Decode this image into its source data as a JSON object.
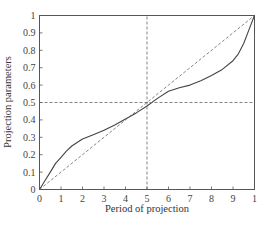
{
  "chart_data": {
    "type": "line",
    "title": "",
    "xlabel": "Period of projection",
    "ylabel": "Projection parameters",
    "xlim": [
      0,
      10
    ],
    "ylim": [
      0,
      1
    ],
    "x_ticks": [
      "0",
      "1",
      "2",
      "3",
      "4",
      "5",
      "6",
      "7",
      "8",
      "9",
      "1"
    ],
    "y_ticks": [
      "0",
      "0.1",
      "0.2",
      "0.3",
      "0.4",
      "0.5",
      "0.6",
      "0.7",
      "0.8",
      "0.9",
      "1"
    ],
    "grid": false,
    "legend": null,
    "series": [
      {
        "name": "projection curve",
        "style": "solid",
        "x": [
          0,
          0.25,
          0.5,
          0.75,
          1,
          1.25,
          1.5,
          2,
          2.5,
          3,
          3.5,
          4,
          4.5,
          5,
          5.5,
          6,
          6.5,
          7,
          7.5,
          8,
          8.5,
          9,
          9.25,
          9.5,
          9.75,
          10
        ],
        "values": [
          0,
          0.05,
          0.1,
          0.15,
          0.185,
          0.22,
          0.25,
          0.29,
          0.315,
          0.34,
          0.37,
          0.405,
          0.44,
          0.48,
          0.525,
          0.565,
          0.585,
          0.6,
          0.625,
          0.655,
          0.69,
          0.74,
          0.78,
          0.84,
          0.92,
          1.0
        ]
      },
      {
        "name": "diagonal reference",
        "style": "dashed",
        "x": [
          0,
          10
        ],
        "values": [
          0,
          1
        ]
      },
      {
        "name": "horizontal reference y=0.5",
        "style": "dashed",
        "x": [
          0,
          10
        ],
        "values": [
          0.5,
          0.5
        ]
      },
      {
        "name": "vertical reference x=5",
        "style": "dashed",
        "x": [
          5,
          5
        ],
        "values": [
          0,
          1
        ]
      }
    ]
  },
  "colors": {
    "axis": "#555555",
    "curve": "#444444",
    "dashed": "#666666"
  }
}
